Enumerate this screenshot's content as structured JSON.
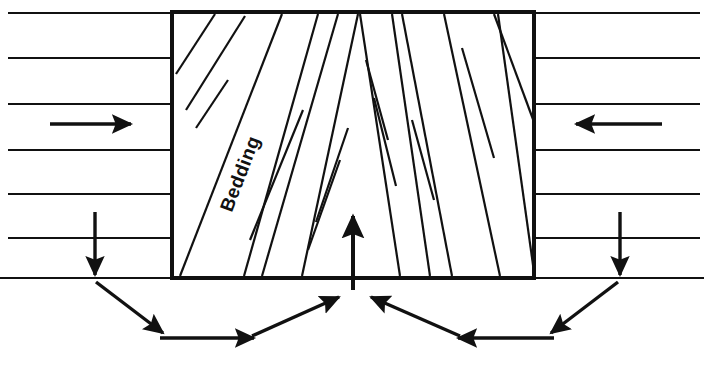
{
  "figure": {
    "type": "hand-drawn geological cross-section diagram",
    "background_color": "#ffffff",
    "ink_color": "#111111"
  },
  "labels": {
    "bedding": "Bedding"
  },
  "block": {
    "name": "deformed-rock-block",
    "left": 172,
    "right": 534,
    "top": 12,
    "bottom": 278,
    "border_color": "#111111",
    "border_width": 4
  },
  "strata": {
    "name": "horizontal-bedding-layers",
    "line_color": "#111111",
    "line_width": 2,
    "left_field": {
      "x_start": 8,
      "x_end": 172,
      "y_values": [
        13,
        58,
        104,
        150,
        194,
        238,
        278
      ]
    },
    "right_field": {
      "x_start": 534,
      "x_end": 700,
      "y_values": [
        13,
        58,
        104,
        150,
        194,
        238,
        278
      ]
    }
  },
  "bedding_fan": {
    "name": "inclined-bedding-traces",
    "description": "Bedding planes inside the block fan outward and converge toward the top centre, dipping toward the block centre on each side",
    "line_color": "#111111",
    "line_width": 2,
    "left_half": [
      {
        "x1": 176,
        "y1": 74,
        "x2": 215,
        "y2": 14
      },
      {
        "x1": 186,
        "y1": 110,
        "x2": 245,
        "y2": 16
      },
      {
        "x1": 196,
        "y1": 128,
        "x2": 228,
        "y2": 80
      },
      {
        "x1": 180,
        "y1": 276,
        "x2": 282,
        "y2": 14
      },
      {
        "x1": 244,
        "y1": 276,
        "x2": 318,
        "y2": 14
      },
      {
        "x1": 250,
        "y1": 240,
        "x2": 303,
        "y2": 110
      },
      {
        "x1": 262,
        "y1": 276,
        "x2": 338,
        "y2": 14
      },
      {
        "x1": 302,
        "y1": 276,
        "x2": 358,
        "y2": 14
      },
      {
        "x1": 308,
        "y1": 250,
        "x2": 340,
        "y2": 160
      },
      {
        "x1": 316,
        "y1": 222,
        "x2": 348,
        "y2": 128
      }
    ],
    "right_half": [
      {
        "x1": 360,
        "y1": 14,
        "x2": 400,
        "y2": 276
      },
      {
        "x1": 366,
        "y1": 60,
        "x2": 388,
        "y2": 140
      },
      {
        "x1": 374,
        "y1": 98,
        "x2": 396,
        "y2": 186
      },
      {
        "x1": 392,
        "y1": 14,
        "x2": 430,
        "y2": 276
      },
      {
        "x1": 402,
        "y1": 14,
        "x2": 452,
        "y2": 276
      },
      {
        "x1": 412,
        "y1": 120,
        "x2": 434,
        "y2": 200
      },
      {
        "x1": 444,
        "y1": 14,
        "x2": 500,
        "y2": 276
      },
      {
        "x1": 462,
        "y1": 48,
        "x2": 494,
        "y2": 158
      },
      {
        "x1": 494,
        "y1": 14,
        "x2": 534,
        "y2": 122
      },
      {
        "x1": 498,
        "y1": 14,
        "x2": 534,
        "y2": 272
      }
    ]
  },
  "arrows": {
    "horizontal_compression": [
      {
        "name": "left-compression-arrow",
        "direction": "right",
        "tail_x": 50,
        "tip_x": 137,
        "y": 124
      },
      {
        "name": "right-compression-arrow",
        "direction": "left",
        "tail_x": 662,
        "tip_x": 570,
        "y": 124
      }
    ],
    "vertical_down": [
      {
        "name": "left-load-arrow",
        "direction": "down",
        "x": 95,
        "tail_y": 212,
        "tip_y": 281
      },
      {
        "name": "right-load-arrow",
        "direction": "down",
        "x": 620,
        "tail_y": 212,
        "tip_y": 281
      }
    ],
    "vertical_up": [
      {
        "name": "centre-uplift-arrow",
        "direction": "up",
        "x": 353,
        "tail_y": 290,
        "tip_y": 208
      }
    ],
    "convergent_lower": [
      {
        "name": "left-outer-diagonal-arrow",
        "from": [
          96,
          282
        ],
        "to": [
          168,
          336
        ]
      },
      {
        "name": "left-inner-horizontal-arrow",
        "from": [
          160,
          338
        ],
        "to": [
          260,
          338
        ]
      },
      {
        "name": "left-inner-diagonal-arrow",
        "from": [
          252,
          336
        ],
        "to": [
          344,
          294
        ]
      },
      {
        "name": "right-outer-diagonal-arrow",
        "from": [
          618,
          282
        ],
        "to": [
          546,
          336
        ]
      },
      {
        "name": "right-inner-horizontal-arrow",
        "from": [
          554,
          338
        ],
        "to": [
          452,
          338
        ]
      },
      {
        "name": "right-inner-diagonal-arrow",
        "from": [
          460,
          336
        ],
        "to": [
          366,
          294
        ]
      }
    ]
  }
}
